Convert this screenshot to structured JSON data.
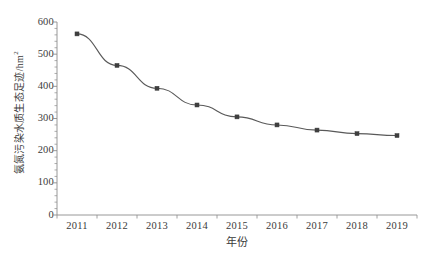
{
  "chart_data": {
    "type": "line",
    "title": "",
    "xlabel": "年份",
    "ylabel": "氨氮污染水质生态足迹/hm",
    "ylabel_sup": "2",
    "categories": [
      "2011",
      "2012",
      "2013",
      "2014",
      "2015",
      "2016",
      "2017",
      "2018",
      "2019"
    ],
    "values": [
      563,
      465,
      394,
      342,
      305,
      280,
      264,
      253,
      247
    ],
    "series": [
      {
        "name": "氨氮污染水质生态足迹",
        "values": [
          563,
          465,
          394,
          342,
          305,
          280,
          264,
          253,
          247
        ]
      }
    ],
    "xlim": [
      2010.5,
      2019.5
    ],
    "ylim": [
      0,
      600
    ],
    "ytick_values": [
      0,
      100,
      200,
      300,
      400,
      500,
      600
    ],
    "ytick_labels": [
      "0",
      "100",
      "200",
      "300",
      "400",
      "500",
      "600"
    ],
    "y_minor_tick_step": 20,
    "grid": false,
    "legend": "none",
    "marker": "square",
    "line_color": "#595959",
    "marker_color": "#3f3f3f",
    "axis_color": "#8c8c8c"
  },
  "caption": {
    "text": ""
  }
}
